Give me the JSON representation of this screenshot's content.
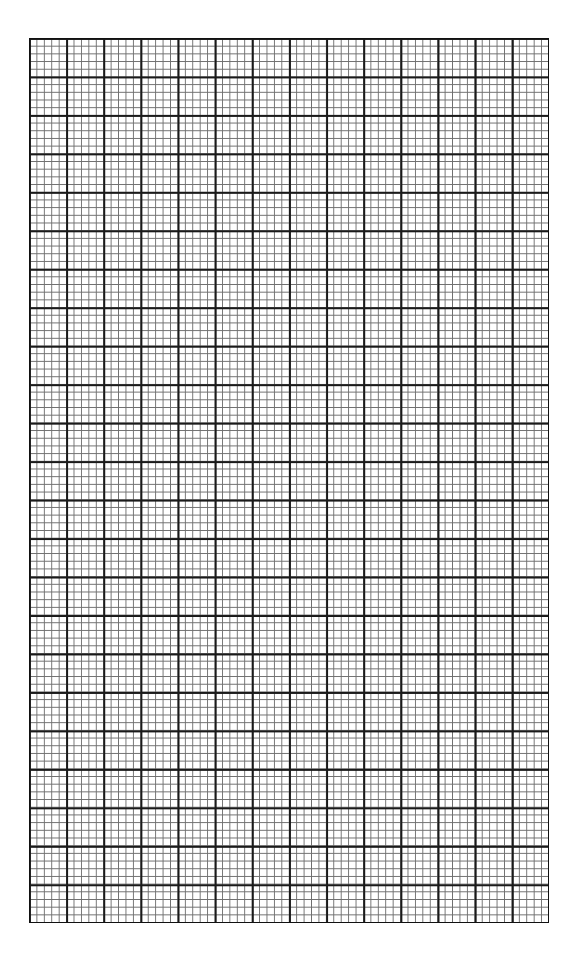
{
  "page": {
    "type": "graph-paper",
    "background_color": "#ffffff",
    "line_color_major": "#1a1a1a",
    "line_color_minor": "#6e6e6e"
  },
  "grid": {
    "major_columns": 14,
    "major_rows": 23,
    "minor_divisions_per_major": 5,
    "left": 29,
    "top": 38,
    "width": 520,
    "height": 885
  }
}
